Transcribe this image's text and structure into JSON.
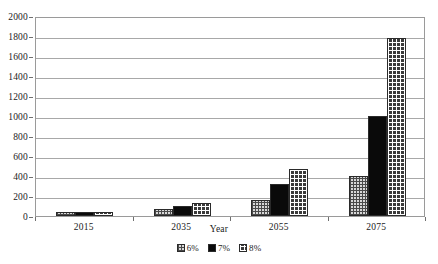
{
  "chart_data": {
    "type": "bar",
    "title": "",
    "subtitle": "",
    "xlabel": "Year",
    "ylabel": "",
    "categories": [
      "2015",
      "2035",
      "2055",
      "2075"
    ],
    "series": [
      {
        "name": "6%",
        "pattern": "crosshatch-gray",
        "values": [
          40,
          75,
          160,
          400
        ]
      },
      {
        "name": "7%",
        "pattern": "solid-black",
        "values": [
          42,
          105,
          320,
          1000
        ]
      },
      {
        "name": "8%",
        "pattern": "grid-dark",
        "values": [
          45,
          130,
          470,
          1780
        ]
      }
    ],
    "ylim": [
      0,
      2000
    ],
    "yticks": [
      0,
      200,
      400,
      600,
      800,
      1000,
      1200,
      1400,
      1600,
      1800,
      2000
    ],
    "ytick_labels": [
      "0",
      "200",
      "400",
      "600",
      "800",
      "1000",
      "1200",
      "1400",
      "1600",
      "1800",
      "2000"
    ],
    "grid": true,
    "grid_axis": "y",
    "legend_position": "bottom",
    "legend_entries": [
      "6%",
      "7%",
      "8%"
    ],
    "colors": {
      "background": "#ffffff",
      "plot_border": "#9a9a9a",
      "gridline": "#a8a8a8",
      "text": "#1a1a1a",
      "series_6": "#d8d8d8",
      "series_7": "#0a0a0a",
      "series_8": "#3a3a3a"
    }
  }
}
